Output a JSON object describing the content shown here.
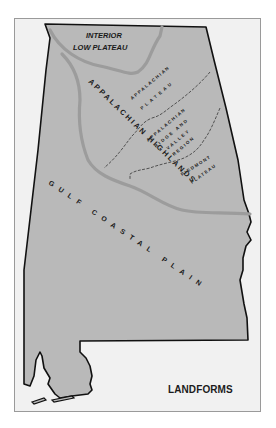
{
  "map": {
    "title": "LANDFORMS",
    "state_fill": "#b9b9b9",
    "boundary_color": "#9c9c9c",
    "frame_bg": "#f1f1f1",
    "regions": {
      "interior_low_plateau_line1": "INTERIOR",
      "interior_low_plateau_line2": "LOW PLATEAU",
      "appalachian_highlands": "APPALACHIAN HIGHLANDS",
      "appalachian_plateau_line1": "APPALACHIAN",
      "appalachian_plateau_line2": "PLATEAU",
      "ridge_valley_line1": "APPALACHIAN",
      "ridge_valley_line2": "RIDGE AND",
      "ridge_valley_line3": "VALLEY",
      "ridge_valley_line4": "REGION",
      "piedmont_line1": "PIEDMONT",
      "piedmont_line2": "PLATEAU",
      "gulf_coastal_plain": "GULF COASTAL PLAIN"
    }
  }
}
